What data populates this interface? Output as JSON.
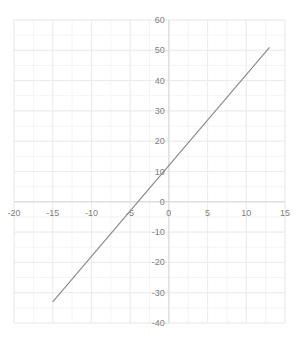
{
  "chart_data": {
    "type": "line",
    "title": "",
    "xlabel": "",
    "ylabel": "",
    "xlim": [
      -20,
      15
    ],
    "ylim": [
      -40,
      60
    ],
    "x_ticks": [
      -20,
      -15,
      -10,
      -5,
      0,
      5,
      10,
      15
    ],
    "y_ticks": [
      -40,
      -30,
      -20,
      -10,
      0,
      10,
      20,
      30,
      40,
      50,
      60
    ],
    "x_tick_labels": [
      "-20",
      "-15",
      "-10",
      "-5",
      "0",
      "5",
      "10",
      "15"
    ],
    "y_tick_labels": [
      "-40",
      "-30",
      "-20",
      "-10",
      "0",
      "10",
      "20",
      "30",
      "40",
      "50",
      "60"
    ],
    "grid": true,
    "legend": null,
    "series": [
      {
        "name": "y = 3x + 12",
        "color": "#8c8c8c",
        "x": [
          -15,
          13
        ],
        "y": [
          -33,
          51
        ]
      }
    ]
  }
}
